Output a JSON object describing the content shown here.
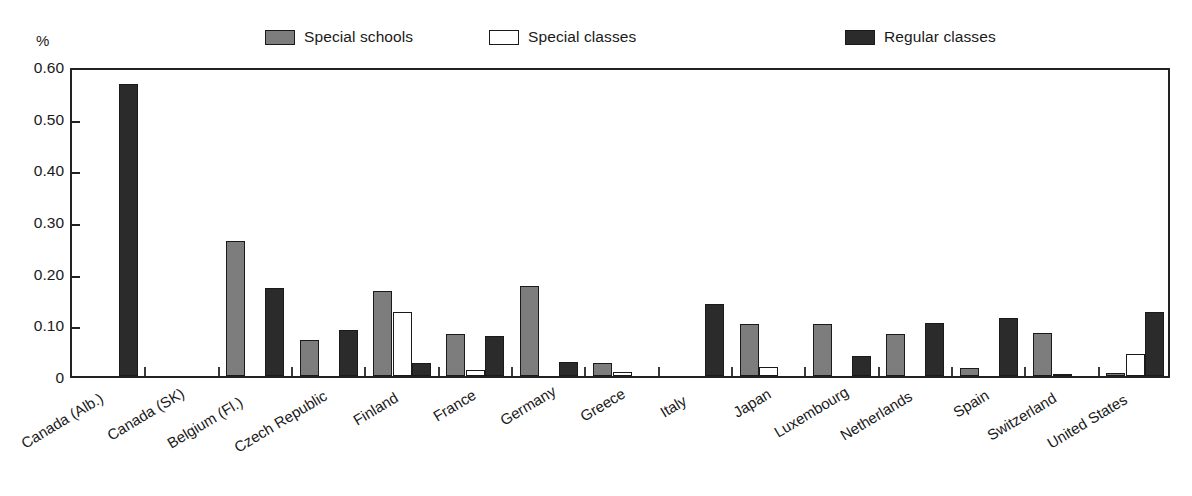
{
  "axis": {
    "y_unit": "%",
    "y_ticks": [
      "0.60",
      "0.50",
      "0.40",
      "0.30",
      "0.20",
      "0.10",
      "0"
    ]
  },
  "legend": {
    "items": [
      {
        "label": "Special schools",
        "swatch": "#7d7d7d",
        "key": "special_schools"
      },
      {
        "label": "Special classes",
        "swatch": "#ffffff",
        "key": "special_classes"
      },
      {
        "label": "Regular classes",
        "swatch": "#2b2b2b",
        "key": "regular_classes"
      }
    ]
  },
  "chart_data": {
    "type": "bar",
    "title": "",
    "xlabel": "",
    "ylabel": "%",
    "ylim": [
      0,
      0.6
    ],
    "yticks": [
      0,
      0.1,
      0.2,
      0.3,
      0.4,
      0.5,
      0.6
    ],
    "grid": false,
    "legend_position": "top",
    "categories": [
      "Canada (Alb.)",
      "Canada (SK)",
      "Belgium (Fl.)",
      "Czech Republic",
      "Finland",
      "France",
      "Germany",
      "Greece",
      "Italy",
      "Japan",
      "Luxembourg",
      "Netherlands",
      "Spain",
      "Switzerland",
      "United States"
    ],
    "series": [
      {
        "name": "Special schools",
        "color": "#7d7d7d",
        "values": [
          0,
          0,
          0.262,
          0.07,
          0.165,
          0.082,
          0.175,
          0.025,
          0,
          0.1,
          0.1,
          0.082,
          0.015,
          0.083,
          0.005
        ]
      },
      {
        "name": "Special classes",
        "color": "#ffffff",
        "values": [
          0,
          0,
          0,
          0,
          0.124,
          0.012,
          0,
          0.007,
          0,
          0.017,
          0,
          0,
          0,
          0.004,
          0.042
        ]
      },
      {
        "name": "Regular classes",
        "color": "#2b2b2b",
        "values": [
          0.565,
          0,
          0.17,
          0.09,
          0.026,
          0.078,
          0.028,
          0,
          0.14,
          0,
          0.038,
          0.102,
          0.112,
          0,
          0.124
        ]
      }
    ]
  }
}
